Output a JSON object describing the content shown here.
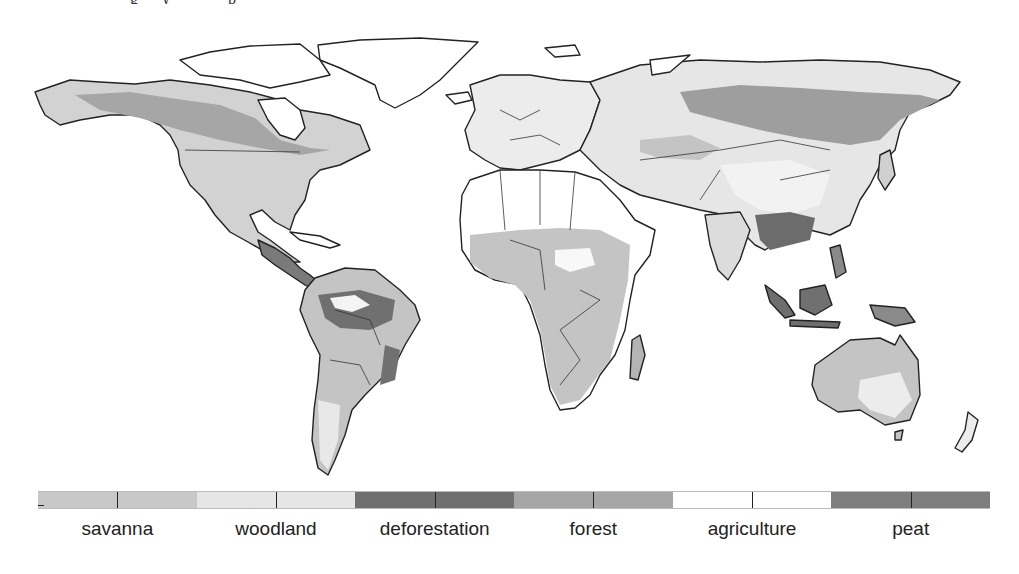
{
  "figure": {
    "top_text_fragment": "g y p",
    "map": {
      "title": "",
      "projection": "equirectangular world map",
      "background": "#ffffff",
      "outline_color": "#222222",
      "regions": [
        {
          "name": "north-america",
          "dominant_classes": [
            "forest",
            "savanna",
            "woodland"
          ]
        },
        {
          "name": "central-america",
          "dominant_classes": [
            "deforestation",
            "savanna"
          ]
        },
        {
          "name": "south-america",
          "dominant_classes": [
            "deforestation",
            "savanna",
            "agriculture"
          ]
        },
        {
          "name": "europe",
          "dominant_classes": [
            "agriculture",
            "woodland"
          ]
        },
        {
          "name": "africa",
          "dominant_classes": [
            "savanna",
            "agriculture"
          ]
        },
        {
          "name": "northern-asia",
          "dominant_classes": [
            "forest",
            "woodland"
          ]
        },
        {
          "name": "southeast-asia",
          "dominant_classes": [
            "peat",
            "deforestation"
          ]
        },
        {
          "name": "australia",
          "dominant_classes": [
            "savanna",
            "woodland"
          ]
        }
      ]
    },
    "legend": {
      "items": [
        {
          "label": "savanna",
          "color": "#c8c8c8"
        },
        {
          "label": "woodland",
          "color": "#e6e6e6"
        },
        {
          "label": "deforestation",
          "color": "#707070"
        },
        {
          "label": "forest",
          "color": "#a6a6a6"
        },
        {
          "label": "agriculture",
          "color": "#ffffff"
        },
        {
          "label": "peat",
          "color": "#7e7e7e"
        }
      ]
    }
  }
}
